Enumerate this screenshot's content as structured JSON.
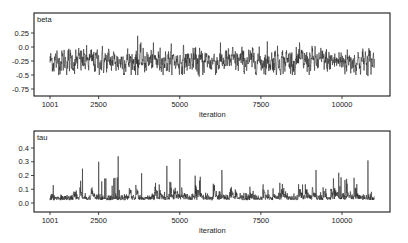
{
  "chart_data": [
    {
      "type": "line",
      "title": "beta",
      "xlabel": "iteration",
      "ylabel": "",
      "x_range": [
        1001,
        11000
      ],
      "xticks": [
        1001,
        2500,
        5000,
        7500,
        10000
      ],
      "xtick_labels": [
        "1001",
        "2500",
        "5000",
        "7500",
        "10000"
      ],
      "yticks": [
        0.25,
        0.0,
        -0.25,
        -0.5,
        -0.75
      ],
      "ytick_labels": [
        "0.25",
        "0.0",
        "-0.25",
        "-0.5",
        "-0.75"
      ],
      "ylim": [
        -0.9,
        0.5
      ],
      "grid": false,
      "series": [
        {
          "name": "beta",
          "description": "MCMC trace, noisy around mean -0.25, range roughly -0.55 to 0.2",
          "mean": -0.25,
          "spread": 0.12,
          "notable_points": [
            {
              "iteration": 3700,
              "value": 0.2
            },
            {
              "iteration": 3700,
              "value": -0.5
            },
            {
              "iteration": 5600,
              "value": -0.53
            },
            {
              "iteration": 7700,
              "value": 0.1
            },
            {
              "iteration": 10800,
              "value": -0.52
            }
          ]
        }
      ]
    },
    {
      "type": "line",
      "title": "tau",
      "xlabel": "iteration",
      "ylabel": "",
      "x_range": [
        1001,
        11000
      ],
      "xticks": [
        1001,
        2500,
        5000,
        7500,
        10000
      ],
      "xtick_labels": [
        "1001",
        "2500",
        "5000",
        "7500",
        "10000"
      ],
      "yticks": [
        0.4,
        0.3,
        0.2,
        0.1,
        0.0
      ],
      "ytick_labels": [
        "0.4",
        "0.3",
        "0.2",
        "0.1",
        "0.0"
      ],
      "ylim": [
        -0.02,
        0.5
      ],
      "grid": false,
      "series": [
        {
          "name": "tau",
          "description": "MCMC trace, nonnegative, baseline near 0.02 with frequent spikes up to ~0.34",
          "baseline": 0.02,
          "notable_points": [
            {
              "iteration": 1100,
              "value": 0.13
            },
            {
              "iteration": 2000,
              "value": 0.25
            },
            {
              "iteration": 2500,
              "value": 0.3
            },
            {
              "iteration": 3100,
              "value": 0.34
            },
            {
              "iteration": 4600,
              "value": 0.27
            },
            {
              "iteration": 5000,
              "value": 0.32
            },
            {
              "iteration": 6300,
              "value": 0.24
            },
            {
              "iteration": 9200,
              "value": 0.24
            },
            {
              "iteration": 9900,
              "value": 0.22
            },
            {
              "iteration": 10800,
              "value": 0.31
            }
          ]
        }
      ]
    }
  ],
  "panels": {
    "beta": {
      "title": "beta",
      "xlabel": "iteration"
    },
    "tau": {
      "title": "tau",
      "xlabel": "iteration"
    }
  },
  "colors": {
    "trace": "#2a2a2a",
    "frame": "#1a1a1a",
    "background": "#ffffff"
  }
}
